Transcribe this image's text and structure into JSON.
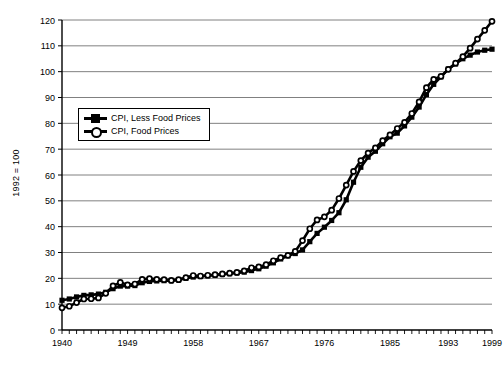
{
  "chart_data": {
    "type": "line",
    "title": "",
    "xlabel": "",
    "ylabel": "1992 = 100",
    "ylim": [
      0,
      120
    ],
    "ytick_step": 10,
    "yticks": [
      0,
      10,
      20,
      30,
      40,
      50,
      60,
      70,
      80,
      90,
      100,
      110,
      120
    ],
    "xlim": [
      1940,
      1999
    ],
    "xticks_labeled": [
      1940,
      1949,
      1958,
      1967,
      1976,
      1985,
      1993,
      1999
    ],
    "xtick_interval_minor": 1,
    "grid": "horizontal",
    "legend_position": "upper-left-inside",
    "x": [
      1940,
      1941,
      1942,
      1943,
      1944,
      1945,
      1946,
      1947,
      1948,
      1949,
      1950,
      1951,
      1952,
      1953,
      1954,
      1955,
      1956,
      1957,
      1958,
      1959,
      1960,
      1961,
      1962,
      1963,
      1964,
      1965,
      1966,
      1967,
      1968,
      1969,
      1970,
      1971,
      1972,
      1973,
      1974,
      1975,
      1976,
      1977,
      1978,
      1979,
      1980,
      1981,
      1982,
      1983,
      1984,
      1985,
      1986,
      1987,
      1988,
      1989,
      1990,
      1991,
      1992,
      1993,
      1994,
      1995,
      1996,
      1997,
      1998,
      1999
    ],
    "series": [
      {
        "name": "CPI, Less Food Prices",
        "marker": "filled-square",
        "color": "#000000",
        "values": [
          11.5,
          12.0,
          12.8,
          13.4,
          13.6,
          13.9,
          14.6,
          16.0,
          17.0,
          17.0,
          17.2,
          18.3,
          18.8,
          19.0,
          19.1,
          19.1,
          19.4,
          20.0,
          20.5,
          20.7,
          21.0,
          21.2,
          21.5,
          21.8,
          22.1,
          22.4,
          23.0,
          23.7,
          24.7,
          26.0,
          27.5,
          28.7,
          29.6,
          31.0,
          34.2,
          37.4,
          39.8,
          42.4,
          45.4,
          50.4,
          57.2,
          63.0,
          66.9,
          69.2,
          72.1,
          74.8,
          76.2,
          79.0,
          82.4,
          86.3,
          91.1,
          95.1,
          98.0,
          101.0,
          103.0,
          105.0,
          106.4,
          107.6,
          108.3,
          108.7
        ]
      },
      {
        "name": "CPI, Food Prices",
        "marker": "open-circle",
        "color": "#000000",
        "values": [
          8.6,
          9.2,
          10.6,
          12.0,
          12.1,
          12.4,
          14.2,
          17.1,
          18.4,
          17.5,
          17.8,
          19.6,
          19.9,
          19.6,
          19.5,
          19.2,
          19.5,
          20.3,
          21.1,
          20.9,
          21.2,
          21.4,
          21.7,
          22.0,
          22.3,
          22.9,
          24.1,
          24.4,
          25.3,
          26.8,
          28.0,
          28.9,
          30.4,
          34.6,
          39.2,
          42.6,
          43.8,
          46.4,
          50.9,
          56.1,
          61.4,
          65.6,
          68.5,
          70.5,
          73.3,
          75.5,
          78.0,
          80.4,
          83.8,
          88.3,
          93.8,
          97.0,
          98.2,
          100.9,
          103.3,
          105.8,
          109.1,
          112.6,
          116.0,
          119.5
        ]
      }
    ]
  },
  "legend": {
    "entries": [
      {
        "label": "CPI, Less Food Prices",
        "marker": "filled-square"
      },
      {
        "label": "CPI, Food Prices",
        "marker": "open-circle"
      }
    ]
  },
  "axis_labels": {
    "y_title": "1992 = 100",
    "y_ticks": [
      "0",
      "10",
      "20",
      "30",
      "40",
      "50",
      "60",
      "70",
      "80",
      "90",
      "100",
      "110",
      "120"
    ],
    "x_ticks": [
      "1940",
      "1949",
      "1958",
      "1967",
      "1976",
      "1985",
      "1993",
      "1999"
    ]
  }
}
